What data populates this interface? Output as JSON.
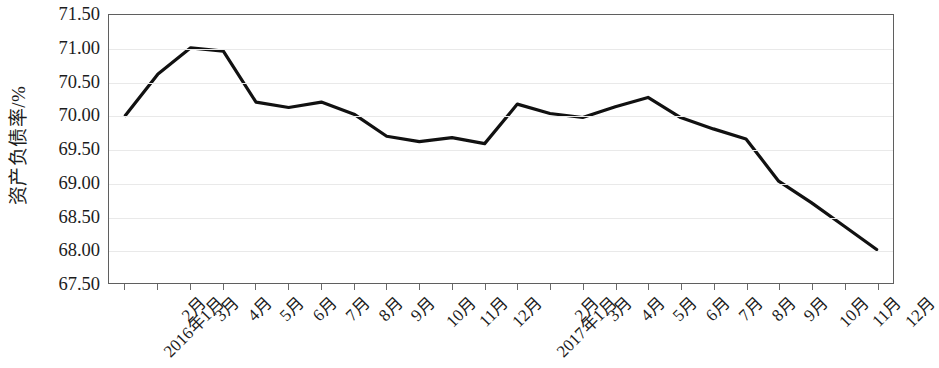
{
  "chart_data": {
    "type": "line",
    "title": "",
    "xlabel": "",
    "ylabel": "资产负债率/%",
    "ylim": [
      67.5,
      71.5
    ],
    "ytick_step": 0.5,
    "ytick_labels": [
      "71.50",
      "71.00",
      "70.50",
      "70.00",
      "69.50",
      "69.00",
      "68.50",
      "68.00",
      "67.50"
    ],
    "ytick_values": [
      71.5,
      71.0,
      70.5,
      70.0,
      69.5,
      69.0,
      68.5,
      68.0,
      67.5
    ],
    "grid": true,
    "grid_axis": "y",
    "legend": false,
    "legend_position": "none",
    "line_color": "#111111",
    "line_width": 3.2,
    "markers": false,
    "categories": [
      "2016年1月",
      "2月",
      "3月",
      "4月",
      "5月",
      "6月",
      "7月",
      "8月",
      "9月",
      "10月",
      "11月",
      "12月",
      "2017年1月",
      "2月",
      "3月",
      "4月",
      "5月",
      "6月",
      "7月",
      "8月",
      "9月",
      "10月",
      "11月",
      "12月"
    ],
    "values": [
      70.0,
      70.62,
      71.01,
      70.96,
      70.2,
      70.12,
      70.2,
      70.02,
      69.69,
      69.61,
      69.67,
      69.58,
      70.17,
      70.03,
      69.97,
      70.13,
      70.27,
      69.97,
      69.8,
      69.65,
      69.02,
      68.7,
      68.35,
      68.0
    ]
  },
  "axes": {
    "y_title": "资产负债率/%"
  }
}
